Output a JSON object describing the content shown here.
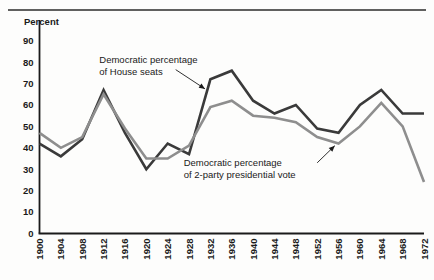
{
  "figure": {
    "background_color": "#fdfdfc",
    "top_rule_color": "#2b2b2b",
    "axis_color": "#1a1a1a"
  },
  "chart_data": {
    "type": "line",
    "title": "",
    "xlabel": "",
    "ylabel": "Percent",
    "ylim": [
      0,
      95
    ],
    "xlim": [
      1900,
      1972
    ],
    "grid": false,
    "legend_position": "inline-annotations",
    "yticks": [
      0,
      10,
      20,
      30,
      40,
      50,
      60,
      70,
      80,
      90
    ],
    "ytick_labels": [
      "0",
      "10",
      "20",
      "30",
      "40",
      "50",
      "60",
      "70",
      "80",
      "90"
    ],
    "x": [
      1900,
      1904,
      1908,
      1912,
      1916,
      1920,
      1924,
      1928,
      1932,
      1936,
      1940,
      1944,
      1948,
      1952,
      1956,
      1960,
      1964,
      1968,
      1972
    ],
    "xtick_labels": [
      "1900",
      "1904",
      "1908",
      "1912",
      "1916",
      "1920",
      "1924",
      "1928",
      "1932",
      "1936",
      "1940",
      "1944",
      "1948",
      "1952",
      "1956",
      "1960",
      "1964",
      "1968",
      "1972"
    ],
    "series": [
      {
        "name": "Democratic percentage of House seats",
        "color": "#3a3a3a",
        "linewidth": 2.6,
        "values": [
          42,
          36,
          44,
          67,
          47,
          30,
          42,
          37,
          72,
          76,
          62,
          56,
          60,
          49,
          47,
          60,
          67,
          56,
          56
        ]
      },
      {
        "name": "Democratic percentage of 2-party presidential vote",
        "color": "#8e8e8e",
        "linewidth": 2.6,
        "values": [
          47,
          40,
          45,
          65,
          49,
          35,
          35,
          41,
          59,
          62,
          55,
          54,
          52,
          45,
          42,
          50,
          61,
          50,
          24
        ]
      }
    ],
    "annotations": [
      {
        "id": "house-seats",
        "lines": [
          "Democratic percentage",
          "of House seats"
        ],
        "text_x": 1911.2,
        "text_y": 79.5,
        "arrow_from_x": 1925.5,
        "arrow_from_y": 76.5,
        "arrow_to_x": 1931.0,
        "arrow_to_y": 67.5
      },
      {
        "id": "presidential-vote",
        "lines": [
          "Democratic percentage",
          "of 2-party presidential vote"
        ],
        "text_x": 1927.0,
        "text_y": 31.5,
        "arrow_from_x": 1952.0,
        "arrow_from_y": 33.0,
        "arrow_to_x": 1955.3,
        "arrow_to_y": 41.0
      }
    ]
  }
}
